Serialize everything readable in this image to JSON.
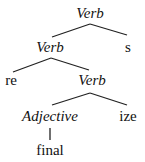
{
  "tree": {
    "root": {
      "label": "Verb",
      "italic": true
    },
    "level1": {
      "left": {
        "label": "Verb",
        "italic": true
      },
      "right": {
        "label": "s",
        "italic": false
      }
    },
    "level2": {
      "left": {
        "label": "re",
        "italic": false
      },
      "right": {
        "label": "Verb",
        "italic": true
      }
    },
    "level3": {
      "left": {
        "label": "Adjective",
        "italic": true
      },
      "right": {
        "label": "ize",
        "italic": false
      }
    },
    "level4": {
      "leaf": {
        "label": "final",
        "italic": false
      }
    }
  }
}
